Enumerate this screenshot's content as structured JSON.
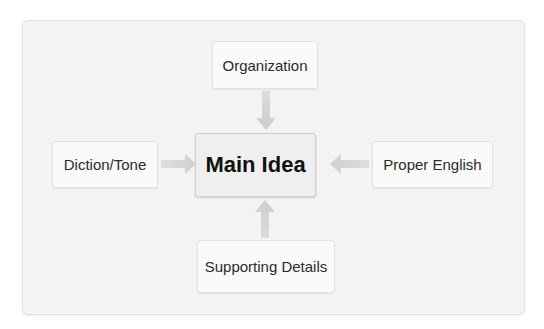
{
  "diagram": {
    "type": "hub-and-spoke concept map",
    "center": {
      "label": "Main Idea"
    },
    "nodes": [
      {
        "id": "top",
        "label": "Organization",
        "position": "top",
        "arrow_direction": "down"
      },
      {
        "id": "left",
        "label": "Diction/Tone",
        "position": "left",
        "arrow_direction": "right"
      },
      {
        "id": "right",
        "label": "Proper English",
        "position": "right",
        "arrow_direction": "left"
      },
      {
        "id": "bottom",
        "label": "Supporting Details",
        "position": "bottom",
        "arrow_direction": "up"
      }
    ],
    "edges": [
      {
        "from": "Organization",
        "to": "Main Idea"
      },
      {
        "from": "Diction/Tone",
        "to": "Main Idea"
      },
      {
        "from": "Proper English",
        "to": "Main Idea"
      },
      {
        "from": "Supporting Details",
        "to": "Main Idea"
      }
    ],
    "colors": {
      "panel_bg": "#f3f3f3",
      "node_bg": "#fafafa",
      "main_bg": "#efefef",
      "arrow": "#d2d2d2",
      "text": "#2b2b2b"
    }
  }
}
